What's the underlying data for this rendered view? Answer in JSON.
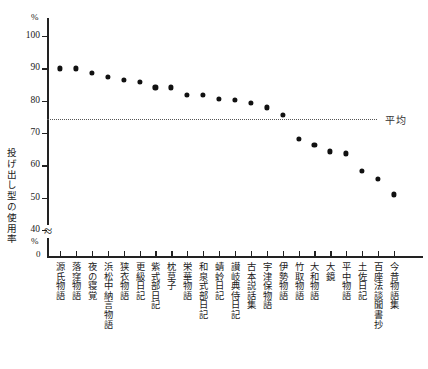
{
  "chart_data": {
    "type": "scatter",
    "title": "",
    "xlabel": "",
    "ylabel": "投げ出し型の使用率",
    "yunit": "%",
    "ylim": [
      40,
      105
    ],
    "yticks": [
      100,
      90,
      80,
      70,
      60,
      50,
      40
    ],
    "axis_break": "≈",
    "axis_zero_label": "0",
    "grid": false,
    "legend": "none",
    "annotations": [
      {
        "name": "average-line",
        "label": "平均",
        "value": 74.2,
        "style": "dotted"
      }
    ],
    "categories": [
      "源氏物語",
      "落窪物語",
      "夜の寝覚",
      "浜松中納言物語",
      "狭衣物語",
      "更級日記",
      "紫式部日記",
      "枕草子",
      "栄華物語",
      "和泉式部日記",
      "蜻蛉日記",
      "讃岐典侍日記",
      "古本説話集",
      "宇津保物語",
      "伊勢物語",
      "竹取物語",
      "大和物語",
      "大鏡",
      "平中物語",
      "土佐日記",
      "百座法談聞書抄",
      "今昔物語集"
    ],
    "values": [
      90.0,
      90.0,
      88.6,
      87.4,
      86.4,
      85.9,
      84.1,
      84.1,
      81.7,
      81.9,
      80.6,
      80.2,
      79.3,
      77.9,
      75.6,
      68.2,
      66.2,
      64.3,
      63.7,
      58.3,
      55.9,
      51.0
    ]
  },
  "axis": {
    "percent_top": "%",
    "percent_bottom": "%",
    "zero": "0"
  }
}
